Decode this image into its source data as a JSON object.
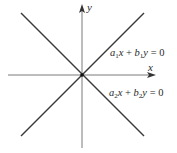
{
  "diagram": {
    "type": "coordinate-plane-lines",
    "axes": {
      "x_label": "x",
      "y_label": "y",
      "origin": [
        82,
        75
      ],
      "axis_color": "#7a7a7a"
    },
    "lines": [
      {
        "name": "line-1",
        "equation": "a1x + b1y = 0",
        "parts": {
          "a": "a",
          "a_sub": "1",
          "x": "x",
          "plus": " + ",
          "b": "b",
          "b_sub": "1",
          "y": "y",
          "rhs": " = 0"
        },
        "from": [
          21,
          136
        ],
        "to": [
          144,
          13
        ],
        "color": "#3a3a3a"
      },
      {
        "name": "line-2",
        "equation": "a2x + b2y = 0",
        "parts": {
          "a": "a",
          "a_sub": "2",
          "x": "x",
          "plus": " + ",
          "b": "b",
          "b_sub": "2",
          "y": "y",
          "rhs": " = 0"
        },
        "from": [
          21,
          13
        ],
        "to": [
          144,
          136
        ],
        "color": "#3a3a3a"
      }
    ]
  }
}
